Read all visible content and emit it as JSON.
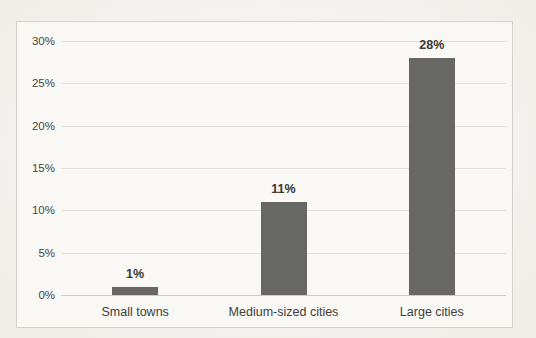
{
  "chart_data": {
    "type": "bar",
    "title": "",
    "xlabel": "",
    "ylabel": "",
    "categories": [
      "Small towns",
      "Medium-sized cities",
      "Large cities"
    ],
    "values": [
      1,
      11,
      28
    ],
    "data_labels": [
      "1%",
      "11%",
      "28%"
    ],
    "ylim": [
      0,
      30
    ],
    "ytick_step": 5,
    "yticks": [
      0,
      5,
      10,
      15,
      20,
      25,
      30
    ],
    "ytick_labels": [
      "0%",
      "5%",
      "10%",
      "15%",
      "20%",
      "25%",
      "30%"
    ],
    "grid": true,
    "legend": false,
    "colors": {
      "bar": "#676764",
      "gridline": "#e3e1db",
      "axis_baseline": "#cfccc5",
      "chart_border": "#d5d2cb",
      "chart_background": "#faf8f5",
      "tick_text": "#454541",
      "label_text": "#393936"
    }
  }
}
